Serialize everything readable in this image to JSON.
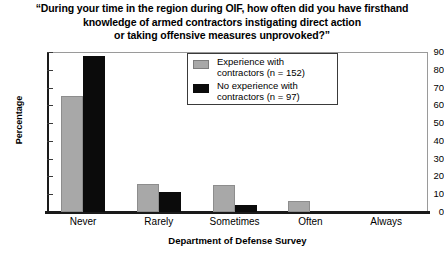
{
  "chart_data": {
    "type": "bar",
    "title": "“During your time in the region during OIF, how often did you have firsthand knowledge of armed contractors instigating direct action or taking offensive measures unprovoked?”",
    "title_lines": [
      "“During your time in the region during OIF, how often did you have firsthand",
      "knowledge of armed contractors instigating direct action",
      "or taking offensive measures unprovoked?”"
    ],
    "categories": [
      "Never",
      "Rarely",
      "Sometimes",
      "Often",
      "Always"
    ],
    "series": [
      {
        "name": "Experience with contractors (n = 152)",
        "values": [
          65,
          16,
          15,
          6,
          0
        ],
        "color": "#a8a8a8"
      },
      {
        "name": "No experience with contractors (n = 97)",
        "values": [
          88,
          11,
          4,
          0,
          0
        ],
        "color": "#0b0b0b"
      }
    ],
    "xlabel": "Department of Defense Survey",
    "ylabel": "Percentage",
    "ylim": [
      0,
      90
    ],
    "yticks": [
      90,
      80,
      70,
      60,
      50,
      40,
      30,
      20,
      10,
      0
    ],
    "grid": false,
    "legend_position": "top-center"
  },
  "legend": {
    "entries": [
      {
        "label_line1": "Experience with",
        "label_line2": "contractors (n = 152)",
        "swatch": "gray"
      },
      {
        "label_line1": "No experience with",
        "label_line2": "contractors (n = 97)",
        "swatch": "black"
      }
    ]
  }
}
